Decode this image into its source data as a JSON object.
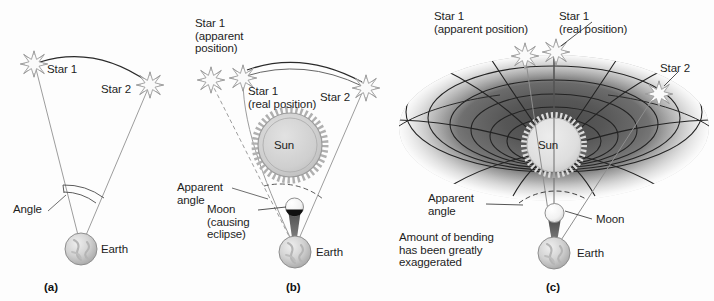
{
  "figure": {
    "background_color": "#fdfdfd",
    "ink_color": "#1d1d1d",
    "ray_color": "#8e8e8e"
  },
  "panels": [
    {
      "tag": "(a)",
      "name": "no-sun-reference",
      "labels": {
        "star1": "Star 1",
        "star2": "Star 2",
        "angle": "Angle",
        "earth": "Earth"
      }
    },
    {
      "tag": "(b)",
      "name": "eclipse-deflection",
      "labels": {
        "star1_apparent": "Star 1\n(apparent\nposition)",
        "star1_real": "Star 1\n(real position)",
        "star2": "Star 2",
        "sun": "Sun",
        "apparent_angle": "Apparent\nangle",
        "moon": "Moon\n(causing\neclipse)",
        "earth": "Earth"
      }
    },
    {
      "tag": "(c)",
      "name": "spacetime-curvature",
      "labels": {
        "star1_apparent": "Star 1\n(apparent position)",
        "star1_real": "Star 1\n(real position)",
        "star2": "Star 2",
        "sun": "Sun",
        "apparent_angle": "Apparent\nangle",
        "moon": "Moon",
        "earth": "Earth",
        "note": "Amount of bending\nhas been greatly\nexaggerated"
      }
    }
  ],
  "icons": {
    "star": "star-burst-icon",
    "sun": "sun-disk-icon",
    "earth": "earth-globe-icon",
    "moon": "moon-disk-icon",
    "shadow_cone": "umbra-cone-icon",
    "funnel": "spacetime-well-icon"
  }
}
